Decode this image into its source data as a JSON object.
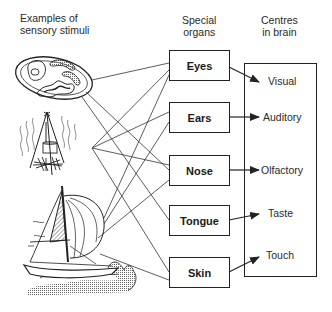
{
  "headers": {
    "stimuli": [
      "Examples of",
      "sensory stimuli"
    ],
    "organs": [
      "Special",
      "organs"
    ],
    "centres": [
      "Centres",
      "in brain"
    ]
  },
  "stimuli": [
    {
      "name": "food-plate",
      "description": "plate with fried egg, sausages and bacon"
    },
    {
      "name": "campfire",
      "description": "cooking pot over campfire with smoke"
    },
    {
      "name": "sailboat",
      "description": "sailboat on waves"
    }
  ],
  "organs": [
    {
      "label": "Eyes",
      "centre": "Visual"
    },
    {
      "label": "Ears",
      "centre": "Auditory"
    },
    {
      "label": "Nose",
      "centre": "Olfactory"
    },
    {
      "label": "Tongue",
      "centre": "Taste"
    },
    {
      "label": "Skin",
      "centre": "Touch"
    }
  ],
  "centres": [
    "Visual",
    "Auditory",
    "Olfactory",
    "Taste",
    "Touch"
  ],
  "colors": {
    "line": "#222222",
    "text": "#1a1a1a",
    "background": "#ffffff"
  }
}
